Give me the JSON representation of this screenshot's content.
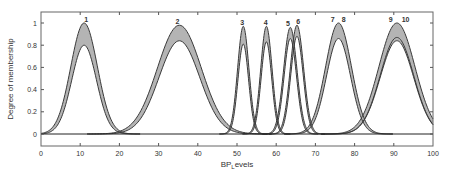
{
  "chart_data": {
    "type": "line",
    "title": "",
    "xlabel": "BP_Levels",
    "xlabel_main": "BP",
    "xlabel_sub": "L",
    "xlabel_rest": "evels",
    "ylabel": "Degree of membership",
    "xlim": [
      0,
      100
    ],
    "ylim": [
      -0.11,
      1.1
    ],
    "x_ticks": [
      0,
      10,
      20,
      30,
      40,
      50,
      60,
      70,
      80,
      90,
      100
    ],
    "y_ticks": [
      0,
      0.2,
      0.4,
      0.6,
      0.8,
      1
    ],
    "y_tick_labels": [
      "0",
      "0.2",
      "0.4",
      "0.6",
      "0.8",
      "1"
    ],
    "grid": false,
    "legend": "none",
    "series": [
      {
        "name": "1",
        "center": 11,
        "sigma": 3.4,
        "upper_height": 1.0,
        "lower_heights": [
          0.8
        ],
        "label_x": 11.5
      },
      {
        "name": "2",
        "center": 35.3,
        "sigma": 5.6,
        "upper_height": 0.98,
        "lower_heights": [
          0.84
        ],
        "label_x": 34.8
      },
      {
        "name": "3",
        "center": 51.6,
        "sigma": 1.45,
        "upper_height": 0.97,
        "lower_heights": [
          0.81
        ],
        "label_x": 51.3
      },
      {
        "name": "4",
        "center": 57.5,
        "sigma": 1.45,
        "upper_height": 0.97,
        "lower_heights": [
          0.83
        ],
        "label_x": 57.3
      },
      {
        "name": "5",
        "center": 63.6,
        "sigma": 1.7,
        "upper_height": 0.96,
        "lower_heights": [
          0.86
        ],
        "label_x": 63.0
      },
      {
        "name": "6",
        "center": 65.3,
        "sigma": 1.7,
        "upper_height": 0.98,
        "lower_heights": [
          0.88
        ],
        "label_x": 65.6
      },
      {
        "name": "7",
        "center": 75.9,
        "sigma": 3.3,
        "upper_height": 1.0,
        "lower_heights": [
          0.86
        ],
        "label_x": 74.4
      },
      {
        "name": "8",
        "center": 75.9,
        "sigma": 3.3,
        "upper_height": 1.0,
        "lower_heights": [
          0.86
        ],
        "label_x": 77.2
      },
      {
        "name": "9",
        "center": 90.8,
        "sigma": 4.6,
        "upper_height": 1.0,
        "lower_heights": [
          0.87,
          0.84
        ],
        "label_x": 89.2
      },
      {
        "name": "10",
        "center": 90.8,
        "sigma": 4.6,
        "upper_height": 1.0,
        "lower_heights": [
          0.87,
          0.84
        ],
        "label_x": 93.0
      }
    ],
    "peak_labels": [
      "1",
      "2",
      "3",
      "4",
      "5",
      "6",
      "7",
      "8",
      "9",
      "10"
    ]
  },
  "colors": {
    "fou_fill": "#b4b4b4",
    "curve_stroke": "#3a3a3a",
    "axis": "#555555",
    "text": "#333333",
    "background": "#ffffff"
  },
  "layout": {
    "plot_left": 41,
    "plot_right": 433,
    "plot_top": 12,
    "plot_bottom": 146,
    "y_zero_px": 134,
    "y_one_px": 23
  }
}
